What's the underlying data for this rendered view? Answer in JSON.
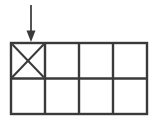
{
  "figure": {
    "title": "",
    "background_color": "#ffffff",
    "stroke_color": "#3a3a3a",
    "arrow_color": "#555555",
    "width": 158,
    "height": 122
  },
  "grid": {
    "label": "rectangle-grid",
    "columns": 4,
    "rows": 2,
    "left": 11,
    "top": 43,
    "right": 147,
    "bottom": 114,
    "cell_width": 34,
    "cell_height": 35.5,
    "line_width": 2,
    "x_edges": [
      11,
      45,
      79,
      113,
      147
    ],
    "y_edges": [
      43,
      78.5,
      114
    ],
    "cells": [
      {
        "name": "cell-r1c1",
        "row": 1,
        "col": 1,
        "marked": true,
        "mark": "x-cross"
      },
      {
        "name": "cell-r1c2",
        "row": 1,
        "col": 2,
        "marked": false,
        "mark": ""
      },
      {
        "name": "cell-r1c3",
        "row": 1,
        "col": 3,
        "marked": false,
        "mark": ""
      },
      {
        "name": "cell-r1c4",
        "row": 1,
        "col": 4,
        "marked": false,
        "mark": ""
      },
      {
        "name": "cell-r2c1",
        "row": 2,
        "col": 1,
        "marked": false,
        "mark": ""
      },
      {
        "name": "cell-r2c2",
        "row": 2,
        "col": 2,
        "marked": false,
        "mark": ""
      },
      {
        "name": "cell-r2c3",
        "row": 2,
        "col": 3,
        "marked": false,
        "mark": ""
      },
      {
        "name": "cell-r2c4",
        "row": 2,
        "col": 4,
        "marked": false,
        "mark": ""
      }
    ]
  },
  "annotation": {
    "arrow": {
      "name": "down-arrow-pointer",
      "direction": "down",
      "points_to_cell": "cell-r1c1",
      "shaft_x": 31,
      "shaft_top_y": 5,
      "shaft_bottom_y": 33,
      "head_tip_y": 42,
      "head_half_width": 4.5,
      "shaft_width": 2,
      "label": ""
    }
  },
  "chart_data": {
    "type": "diagram",
    "title": "",
    "total_cells": 8,
    "marked_cells": 1,
    "unmarked_cells": 7
  }
}
